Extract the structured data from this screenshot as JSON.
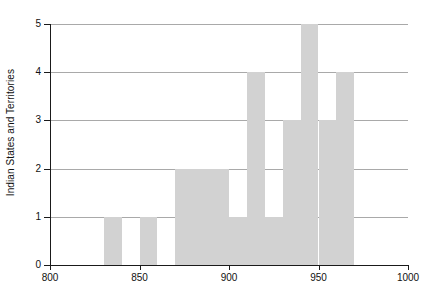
{
  "chart_data": {
    "type": "bar",
    "title": "",
    "subtitle": "",
    "xlabel": "",
    "ylabel": "Indian States and Territories",
    "xlim": [
      800,
      1000
    ],
    "ylim": [
      0,
      5
    ],
    "bin_width": 10,
    "grid": true,
    "legend": null,
    "bar_color": "#d2d2d2",
    "axis_color": "#1a1a1a",
    "gridline_color": "#9a9a9a",
    "xticks": [
      800,
      850,
      900,
      950,
      1000
    ],
    "xtick_labels": [
      "800",
      "850",
      "900",
      "950",
      "1000"
    ],
    "yticks": [
      0,
      1,
      2,
      3,
      4,
      5
    ],
    "ytick_labels": [
      "0",
      "1",
      "2",
      "3",
      "4",
      "5"
    ],
    "categories": [
      "800-810",
      "810-820",
      "820-830",
      "830-840",
      "840-850",
      "850-860",
      "860-870",
      "870-880",
      "880-890",
      "890-900",
      "900-910",
      "910-920",
      "920-930",
      "930-940",
      "940-950",
      "950-960",
      "960-970",
      "970-980",
      "980-990",
      "990-1000"
    ],
    "bins": [
      {
        "x0": 800,
        "x1": 810,
        "count": 0
      },
      {
        "x0": 810,
        "x1": 820,
        "count": 0
      },
      {
        "x0": 820,
        "x1": 830,
        "count": 0
      },
      {
        "x0": 830,
        "x1": 840,
        "count": 1
      },
      {
        "x0": 840,
        "x1": 850,
        "count": 0
      },
      {
        "x0": 850,
        "x1": 860,
        "count": 1
      },
      {
        "x0": 860,
        "x1": 870,
        "count": 0
      },
      {
        "x0": 870,
        "x1": 880,
        "count": 2
      },
      {
        "x0": 880,
        "x1": 890,
        "count": 2
      },
      {
        "x0": 890,
        "x1": 900,
        "count": 2
      },
      {
        "x0": 900,
        "x1": 910,
        "count": 1
      },
      {
        "x0": 910,
        "x1": 920,
        "count": 4
      },
      {
        "x0": 920,
        "x1": 930,
        "count": 1
      },
      {
        "x0": 930,
        "x1": 940,
        "count": 3
      },
      {
        "x0": 940,
        "x1": 950,
        "count": 5
      },
      {
        "x0": 950,
        "x1": 960,
        "count": 3
      },
      {
        "x0": 960,
        "x1": 970,
        "count": 4
      },
      {
        "x0": 970,
        "x1": 980,
        "count": 0
      },
      {
        "x0": 980,
        "x1": 990,
        "count": 0
      },
      {
        "x0": 990,
        "x1": 1000,
        "count": 0
      }
    ],
    "values": [
      0,
      0,
      0,
      1,
      0,
      1,
      0,
      2,
      2,
      2,
      1,
      4,
      1,
      3,
      5,
      3,
      4,
      0,
      0,
      0
    ]
  }
}
